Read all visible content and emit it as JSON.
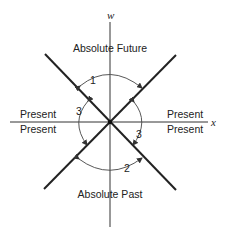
{
  "diagram": {
    "type": "spacetime light-cone diagram",
    "axes": {
      "vertical_label": "w",
      "horizontal_label": "x"
    },
    "regions": {
      "top": "Absolute Future",
      "bottom": "Absolute Past",
      "left_upper": "Present",
      "left_lower": "Present",
      "right_upper": "Present",
      "right_lower": "Present"
    },
    "arc_labels": {
      "top_arc": "1",
      "bottom_arc": "2",
      "left_arc": "3",
      "right_arc": "3"
    },
    "colors": {
      "line": "#222222",
      "background": "#ffffff"
    }
  }
}
